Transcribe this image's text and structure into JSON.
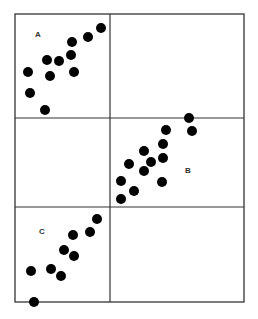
{
  "figure": {
    "frame": {
      "x": 15,
      "y": 14,
      "width": 229,
      "height": 288
    },
    "dividers": {
      "vertical_x": 110,
      "horizontal_y": [
        118,
        207
      ]
    },
    "line_color": "#333333",
    "dot_color": "#000000",
    "dot_radius": 5,
    "panels": [
      {
        "id": "A",
        "label": "A",
        "label_pos": [
          35,
          37
        ],
        "points": [
          [
            101,
            28
          ],
          [
            88,
            37
          ],
          [
            72,
            42
          ],
          [
            71,
            55
          ],
          [
            47,
            60
          ],
          [
            59,
            61
          ],
          [
            28,
            72
          ],
          [
            50,
            76
          ],
          [
            74,
            72
          ],
          [
            30,
            93
          ],
          [
            45,
            110
          ]
        ]
      },
      {
        "id": "B",
        "label": "B",
        "label_pos": [
          185,
          173
        ],
        "points": [
          [
            189,
            118
          ],
          [
            192,
            131
          ],
          [
            166,
            130
          ],
          [
            163,
            144
          ],
          [
            144,
            151
          ],
          [
            163,
            158
          ],
          [
            151,
            162
          ],
          [
            129,
            164
          ],
          [
            144,
            171
          ],
          [
            162,
            182
          ],
          [
            121,
            181
          ],
          [
            134,
            191
          ],
          [
            121,
            199
          ]
        ]
      },
      {
        "id": "C",
        "label": "C",
        "label_pos": [
          39,
          234
        ],
        "points": [
          [
            97,
            219
          ],
          [
            90,
            232
          ],
          [
            73,
            235
          ],
          [
            64,
            250
          ],
          [
            74,
            256
          ],
          [
            31,
            271
          ],
          [
            51,
            269
          ],
          [
            61,
            276
          ],
          [
            34,
            302
          ]
        ]
      }
    ]
  }
}
